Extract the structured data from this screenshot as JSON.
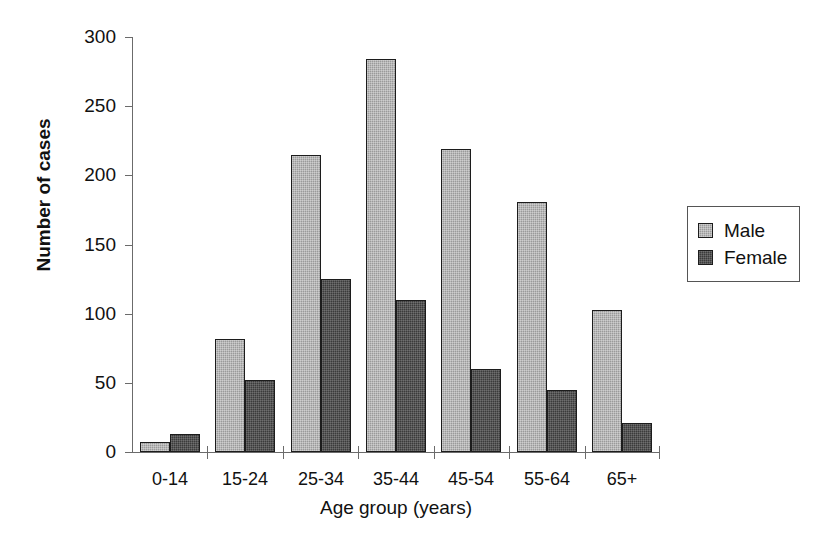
{
  "chart_data": {
    "type": "bar",
    "title": "",
    "xlabel": "Age group (years)",
    "ylabel": "Number of cases",
    "categories": [
      "0-14",
      "15-24",
      "25-34",
      "35-44",
      "45-54",
      "55-64",
      "65+"
    ],
    "series": [
      {
        "name": "Male",
        "color": "#9a9a9a",
        "values": [
          7,
          82,
          215,
          284,
          219,
          181,
          103
        ]
      },
      {
        "name": "Female",
        "color": "#3b3b3b",
        "values": [
          13,
          52,
          125,
          110,
          60,
          45,
          21
        ]
      }
    ],
    "ylim": [
      0,
      300
    ],
    "ytick_values": [
      0,
      50,
      100,
      150,
      200,
      250,
      300
    ],
    "ytick_labels": [
      "0",
      "50",
      "100",
      "150",
      "200",
      "250",
      "300"
    ],
    "grid": false,
    "legend_position": "right"
  },
  "legend": {
    "entries": [
      {
        "label": "Male"
      },
      {
        "label": "Female"
      }
    ]
  }
}
